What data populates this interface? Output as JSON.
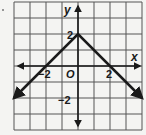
{
  "chart_data": {
    "type": "line",
    "title": "",
    "function": "y = -|x| + 2",
    "xlabel": "x",
    "ylabel": "y",
    "origin_label": "O",
    "xlim": [
      -4,
      4
    ],
    "ylim": [
      -4,
      4
    ],
    "grid": true,
    "grid_step": 1,
    "x_tick_labels": [
      {
        "value": -2,
        "label": "−2"
      },
      {
        "value": 2,
        "label": "2"
      }
    ],
    "y_tick_labels": [
      {
        "value": 2,
        "label": "2"
      },
      {
        "value": -2,
        "label": "−2"
      }
    ],
    "series": [
      {
        "name": "y = -|x| + 2",
        "x": [
          -4,
          0,
          4
        ],
        "y": [
          -2,
          2,
          -2
        ],
        "arrows_at_ends": true,
        "color": "#1a1a1a"
      }
    ],
    "legend": null
  },
  "labels": {
    "x_axis": "x",
    "y_axis": "y",
    "origin": "O",
    "x_neg2": "−2",
    "x_pos2": "2",
    "y_pos2": "2",
    "y_neg2": "−2"
  },
  "colors": {
    "background": "#f4f4f2",
    "grid": "#555555",
    "axis": "#1a1a1a",
    "graph_line": "#1a1a1a"
  }
}
